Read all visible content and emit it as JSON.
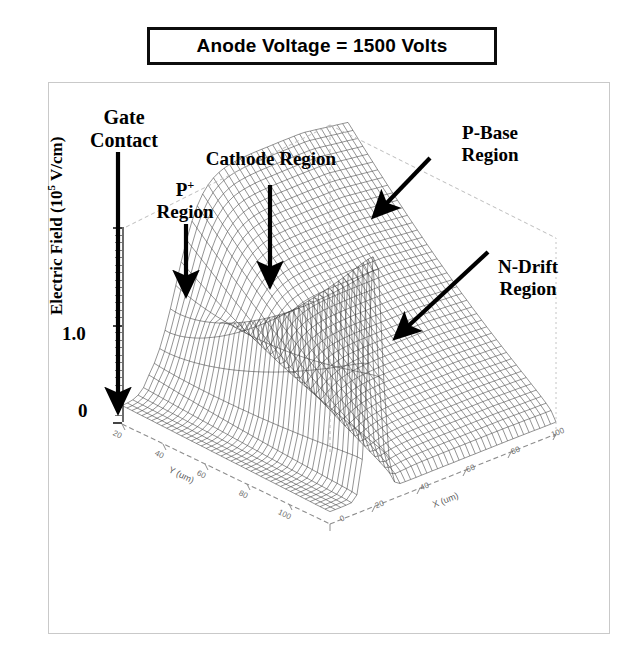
{
  "title": {
    "text": "Anode Voltage = 1500 Volts"
  },
  "axes": {
    "y_title_main": "Electric Field  (10",
    "y_title_exp": "5",
    "y_title_unit": " V/cm)",
    "y_ticks": [
      "1.0",
      "0"
    ],
    "x_axis_name": "X (um)",
    "x_ticks": [
      "0",
      "20",
      "40",
      "60",
      "80",
      "100"
    ],
    "y_axis_name": "Y (um)",
    "y_depth_ticks": [
      "0",
      "20",
      "40",
      "60",
      "80",
      "100"
    ]
  },
  "annotations": [
    {
      "id": "gate-contact",
      "line1": "Gate",
      "line2": "Contact"
    },
    {
      "id": "p-plus-region",
      "line1": "P",
      "sup": "+",
      "line2": "Region"
    },
    {
      "id": "cathode-region",
      "line1": "Cathode Region",
      "line2": ""
    },
    {
      "id": "p-base-region",
      "line1": "P-Base",
      "line2": "Region"
    },
    {
      "id": "n-drift-region",
      "line1": "N-Drift",
      "line2": "Region"
    }
  ],
  "colors": {
    "ink": "#000000",
    "frame": "#c9c9c9",
    "axis_gray": "#6e6e6e",
    "mesh": "#3a3a3a"
  },
  "chart_data": {
    "type": "surface",
    "title": "Anode Voltage = 1500 Volts",
    "xlabel": "X (um)",
    "ylabel": "Y (um)",
    "zlabel": "Electric Field (10^5 V/cm)",
    "xlim": [
      0,
      100
    ],
    "ylim": [
      0,
      100
    ],
    "zlim": [
      0,
      1.8
    ],
    "z_ticks": [
      0,
      1.0
    ],
    "x_ticks": [
      0,
      20,
      40,
      60,
      80,
      100
    ],
    "y_ticks": [
      0,
      20,
      40,
      60,
      80,
      100
    ],
    "grid": true,
    "legend": "none",
    "annotations": [
      {
        "label": "Gate Contact",
        "z": 0.0,
        "note": "left edge, field near zero"
      },
      {
        "label": "P+ Region",
        "z": 1.6,
        "note": "sharp peak"
      },
      {
        "label": "Cathode Region",
        "z": 0.15,
        "note": "low valley"
      },
      {
        "label": "P-Base Region",
        "z": 1.3,
        "note": "plateau ridge edge"
      },
      {
        "label": "N-Drift Region",
        "z": 1.2,
        "note": "broad plateau"
      }
    ],
    "profiles": {
      "x": [
        0,
        5,
        10,
        14,
        17,
        19,
        20,
        21,
        23,
        26,
        30,
        35,
        40,
        50,
        60,
        70,
        80,
        90,
        100
      ],
      "z_near_edge": [
        0.02,
        0.05,
        0.1,
        0.45,
        1.1,
        1.55,
        1.6,
        1.35,
        0.55,
        0.2,
        0.12,
        0.1,
        0.1,
        0.1,
        0.1,
        0.1,
        0.1,
        0.1,
        0.1
      ],
      "z_far_edge": [
        0.05,
        0.1,
        0.2,
        0.55,
        0.95,
        1.15,
        1.22,
        1.26,
        1.28,
        1.3,
        1.31,
        1.32,
        1.32,
        1.31,
        1.3,
        1.29,
        1.28,
        1.27,
        1.26
      ]
    }
  }
}
